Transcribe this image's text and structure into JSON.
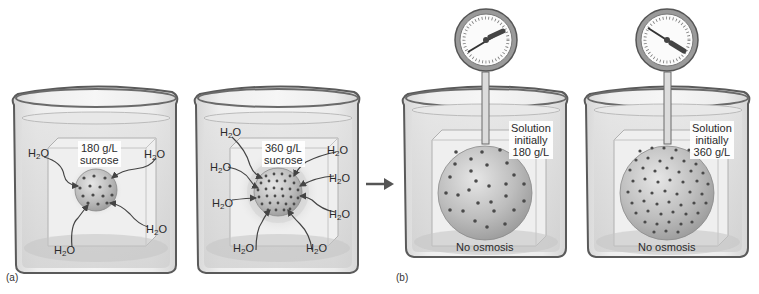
{
  "figure": {
    "panel_a": {
      "letter": "(a)",
      "beakers": [
        {
          "concentration_label": "180 g/L",
          "solute_label": "sucrose",
          "water_labels": [
            "H",
            "2",
            "O"
          ],
          "water_arrow_count": 4
        },
        {
          "concentration_label": "360 g/L",
          "solute_label": "sucrose",
          "water_labels": [
            "H",
            "2",
            "O"
          ],
          "water_arrow_count": 8
        }
      ]
    },
    "transition_arrow": "right-arrow",
    "panel_b": {
      "letter": "(b)",
      "beakers": [
        {
          "label_line1": "Solution",
          "label_line2": "initially",
          "label_line3": "180 g/L",
          "caption": "No osmosis",
          "gauge": "pressure-gauge"
        },
        {
          "label_line1": "Solution",
          "label_line2": "initially",
          "label_line3": "360 g/L",
          "caption": "No osmosis",
          "gauge": "pressure-gauge"
        }
      ]
    },
    "colors": {
      "beaker_outline": "#5a5a5a",
      "glass": "#e4e4e4",
      "water": "#d2d2d2",
      "sphere": "#b5b5b5",
      "dot": "#4a4a4a"
    }
  }
}
